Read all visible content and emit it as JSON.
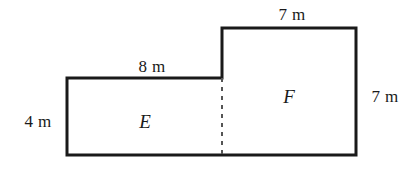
{
  "figure": {
    "type": "composite-rectilinear-figure",
    "background_color": "#ffffff",
    "stroke_color": "#1a1a1a",
    "divider_color": "#555555",
    "outline_width_px": 3,
    "divider_width_px": 2,
    "units": "m",
    "outline_path": "M 67 78 L 222 78 L 222 28 L 356 28 L 356 155 L 67 155 Z",
    "divider_path": "M 222 78 L 222 155",
    "vertices": [
      {
        "name": "top-left-of-E",
        "x": 67,
        "y": 78
      },
      {
        "name": "step-inner-corner",
        "x": 222,
        "y": 78
      },
      {
        "name": "top-left-of-F",
        "x": 222,
        "y": 28
      },
      {
        "name": "top-right",
        "x": 356,
        "y": 28
      },
      {
        "name": "bottom-right",
        "x": 356,
        "y": 155
      },
      {
        "name": "bottom-left",
        "x": 67,
        "y": 155
      }
    ],
    "dimension_labels": [
      {
        "id": "top-7m",
        "text": "7 m",
        "x": 292,
        "y": 15,
        "edge": "top-edge-of-F"
      },
      {
        "id": "left-4m",
        "text": "4 m",
        "x": 38,
        "y": 122,
        "edge": "left-edge-of-E"
      },
      {
        "id": "mid-8m",
        "text": "8 m",
        "x": 152,
        "y": 67,
        "edge": "top-edge-of-E"
      },
      {
        "id": "right-7m",
        "text": "7 m",
        "x": 385,
        "y": 97,
        "edge": "right-edge-of-F"
      }
    ],
    "region_labels": [
      {
        "id": "region-E",
        "text": "E",
        "x": 145,
        "y": 122
      },
      {
        "id": "region-F",
        "text": "F",
        "x": 289,
        "y": 97
      }
    ]
  }
}
